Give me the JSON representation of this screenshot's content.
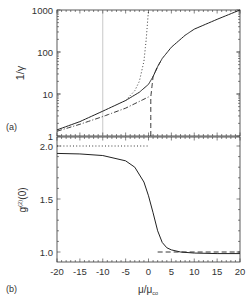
{
  "chart_data": [
    {
      "panel_label": "(a)",
      "type": "line",
      "xlabel": "",
      "ylabel": "1/γ",
      "yscale": "log",
      "xlim": [
        -20,
        20
      ],
      "ylim": [
        1,
        1000
      ],
      "ytick_labels": [
        "1",
        "10",
        "100",
        "1000"
      ],
      "grid": false,
      "vertical_reference_line_x": -10,
      "series": [
        {
          "name": "solid",
          "style": "solid",
          "x": [
            -20,
            -15,
            -10,
            -5,
            -2,
            0,
            1,
            2,
            3,
            5,
            8,
            10,
            15,
            20
          ],
          "y": [
            1.4,
            2.2,
            3.9,
            7.0,
            11,
            17,
            26,
            45,
            70,
            130,
            250,
            350,
            600,
            1000
          ]
        },
        {
          "name": "dash-dot",
          "style": "dashdot",
          "x": [
            -20,
            -15,
            -10,
            -5,
            0
          ],
          "y": [
            1.3,
            1.9,
            2.9,
            4.6,
            8.5
          ]
        },
        {
          "name": "dotted",
          "style": "dotted",
          "x": [
            -5,
            -3,
            -2,
            -1,
            -0.5,
            0
          ],
          "y": [
            7,
            12,
            20,
            60,
            200,
            1000
          ]
        },
        {
          "name": "dashed",
          "style": "dashed",
          "x": [
            0.5,
            0.5,
            1,
            2,
            3
          ],
          "y": [
            1,
            8.5,
            26,
            45,
            70
          ]
        }
      ]
    },
    {
      "panel_label": "(b)",
      "type": "line",
      "xlabel": "μ/μ_co",
      "ylabel": "g^(2)(0)",
      "xlim": [
        -20,
        20
      ],
      "ylim": [
        0.9,
        2.05
      ],
      "xtick_labels": [
        "-20",
        "-15",
        "-10",
        "-5",
        "0",
        "5",
        "10",
        "15",
        "20"
      ],
      "ytick_labels": [
        "1.0",
        "1.5",
        "2.0"
      ],
      "grid": false,
      "series": [
        {
          "name": "solid",
          "style": "solid",
          "x": [
            -20,
            -15,
            -10,
            -5,
            -3,
            -1,
            0,
            1,
            2,
            3,
            4,
            5,
            7,
            10,
            15,
            20
          ],
          "y": [
            1.93,
            1.925,
            1.91,
            1.86,
            1.8,
            1.66,
            1.53,
            1.37,
            1.2,
            1.09,
            1.04,
            1.02,
            1.0,
            0.99,
            0.985,
            0.985
          ]
        },
        {
          "name": "dotted",
          "style": "dotted",
          "x": [
            -20,
            0
          ],
          "y": [
            2.0,
            2.0
          ]
        },
        {
          "name": "dashed",
          "style": "dashed",
          "x": [
            2,
            20
          ],
          "y": [
            1.0,
            1.0
          ]
        }
      ]
    }
  ],
  "labels": {
    "panel_a": "(a)",
    "panel_b": "(b)",
    "ylabel_a": "1/γ",
    "ylabel_b_main": "g",
    "ylabel_b_sup": "(2)",
    "ylabel_b_tail": "(0)",
    "xlabel_main": "μ/μ",
    "xlabel_sub": "co",
    "yticks_a": [
      "1000",
      "100",
      "10",
      "1"
    ],
    "yticks_b": [
      "2.0",
      "1.5",
      "1.0"
    ],
    "xticks": [
      "-20",
      "-15",
      "-10",
      "-5",
      "0",
      "5",
      "10",
      "15",
      "20"
    ]
  }
}
